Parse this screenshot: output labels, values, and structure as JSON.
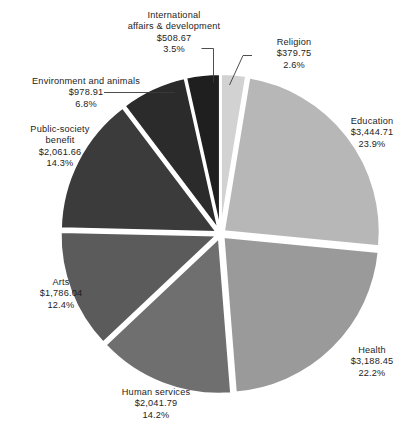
{
  "chart_data": {
    "type": "pie",
    "title": "",
    "subtitle": "",
    "xlabel": "",
    "ylabel": "",
    "legend_position": "none",
    "grid": false,
    "units": "$ (billions)",
    "categories": [
      "Religion",
      "Education",
      "Health",
      "Human services",
      "Arts",
      "Public-society benefit",
      "Environment and animals",
      "International affairs & development"
    ],
    "values": [
      379.75,
      3444.71,
      3188.45,
      2041.79,
      1786.04,
      2061.66,
      978.91,
      508.67
    ],
    "percents": [
      2.6,
      23.9,
      22.2,
      14.2,
      12.4,
      14.3,
      6.8,
      3.5
    ],
    "value_labels": [
      "$379.75",
      "$3,444.71",
      "$3,188.45",
      "$2,041.79",
      "$1,786.04",
      "$2,061.66",
      "$978.91",
      "$508.67"
    ],
    "percent_labels": [
      "2.6%",
      "23.9%",
      "22.2%",
      "14.2%",
      "12.4%",
      "14.3%",
      "6.8%",
      "3.5%"
    ],
    "colors": [
      "#d2d2d2",
      "#b7b7b7",
      "#9a9a9a",
      "#6f6f6f",
      "#5b5b5b",
      "#3b3b3b",
      "#2b2b2b",
      "#1f1f1f"
    ]
  },
  "slices": {
    "religion": {
      "name": "Religion",
      "value": "$379.75",
      "percent": "2.6%",
      "color": "#d2d2d2"
    },
    "education": {
      "name": "Education",
      "value": "$3,444.71",
      "percent": "23.9%",
      "color": "#b7b7b7"
    },
    "health": {
      "name": "Health",
      "value": "$3,188.45",
      "percent": "22.2%",
      "color": "#9a9a9a"
    },
    "human_services": {
      "name": "Human services",
      "value": "$2,041.79",
      "percent": "14.2%",
      "color": "#6f6f6f"
    },
    "arts": {
      "name": "Arts",
      "value": "$1,786.04",
      "percent": "12.4%",
      "color": "#5b5b5b"
    },
    "public_society_benefit": {
      "name_line1": "Public-society",
      "name_line2": "benefit",
      "value": "$2,061.66",
      "percent": "14.3%",
      "color": "#3b3b3b"
    },
    "environment_and_animals": {
      "name": "Environment and animals",
      "value": "$978.91",
      "percent": "6.8%",
      "color": "#2b2b2b"
    },
    "international_affairs": {
      "name_line1": "International",
      "name_line2": "affairs & development",
      "value": "$508.67",
      "percent": "3.5%",
      "color": "#1f1f1f"
    }
  },
  "style": {
    "background": "#ffffff",
    "leader_line_color": "#3a3a3a",
    "text_color": "#1d1d1d"
  }
}
